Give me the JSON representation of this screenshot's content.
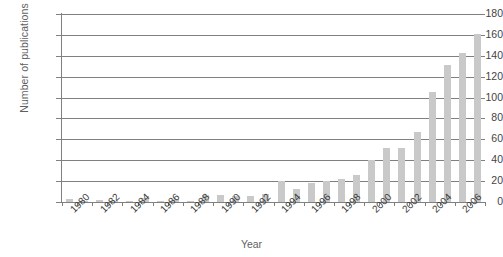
{
  "chart_data": {
    "type": "bar",
    "title": "",
    "xlabel": "Year",
    "ylabel": "Number of publications",
    "categories": [
      1980,
      1981,
      1982,
      1983,
      1984,
      1985,
      1986,
      1987,
      1988,
      1989,
      1990,
      1991,
      1992,
      1993,
      1994,
      1995,
      1996,
      1997,
      1998,
      1999,
      2000,
      2001,
      2002,
      2003,
      2004,
      2005,
      2006,
      2007
    ],
    "values": [
      3,
      1,
      2,
      1,
      1,
      4,
      1,
      3,
      1,
      7,
      7,
      6,
      6,
      8,
      20,
      12,
      18,
      20,
      22,
      26,
      40,
      52,
      52,
      67,
      105,
      131,
      143,
      161
    ],
    "ylim": [
      0,
      180
    ],
    "ytick_labels": [
      "180",
      "160",
      "140",
      "120",
      "100",
      "80",
      "60",
      "40",
      "20",
      "0"
    ],
    "ytick_values": [
      180,
      160,
      140,
      120,
      100,
      80,
      60,
      40,
      20,
      0
    ],
    "xtick_labels": [
      "1980",
      "1982",
      "1984",
      "1986",
      "1988",
      "1990",
      "1992",
      "1994",
      "1996",
      "1998",
      "2000",
      "2002",
      "2004",
      "2006"
    ],
    "xtick_values": [
      1980,
      1982,
      1984,
      1986,
      1988,
      1990,
      1992,
      1994,
      1996,
      1998,
      2000,
      2002,
      2004,
      2006
    ],
    "grid": "horizontal",
    "legend": "none",
    "bar_color": "#c9c9c9",
    "axis_color": "#808080"
  }
}
